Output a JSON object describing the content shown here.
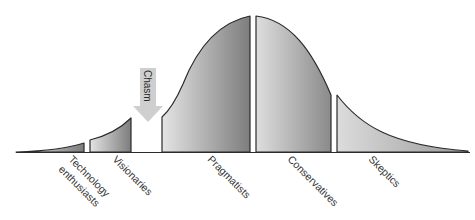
{
  "diagram": {
    "type": "technology-adoption-lifecycle",
    "chasm": {
      "label": "Chasm",
      "arrow_color": "#c9c9c9"
    },
    "segments": [
      {
        "id": "technology-enthusiasts",
        "label_lines": [
          "Technology",
          "enthusiasts"
        ]
      },
      {
        "id": "visionaries",
        "label_lines": [
          "Visionaries"
        ]
      },
      {
        "id": "pragmatists",
        "label_lines": [
          "Pragmatists"
        ]
      },
      {
        "id": "conservatives",
        "label_lines": [
          "Conservatives"
        ]
      },
      {
        "id": "skeptics",
        "label_lines": [
          "Skeptics"
        ]
      }
    ],
    "colors": {
      "outline": "#2b2b2b",
      "fill_light": "#e6e6e6",
      "fill_dark": "#7a7a7a"
    }
  }
}
